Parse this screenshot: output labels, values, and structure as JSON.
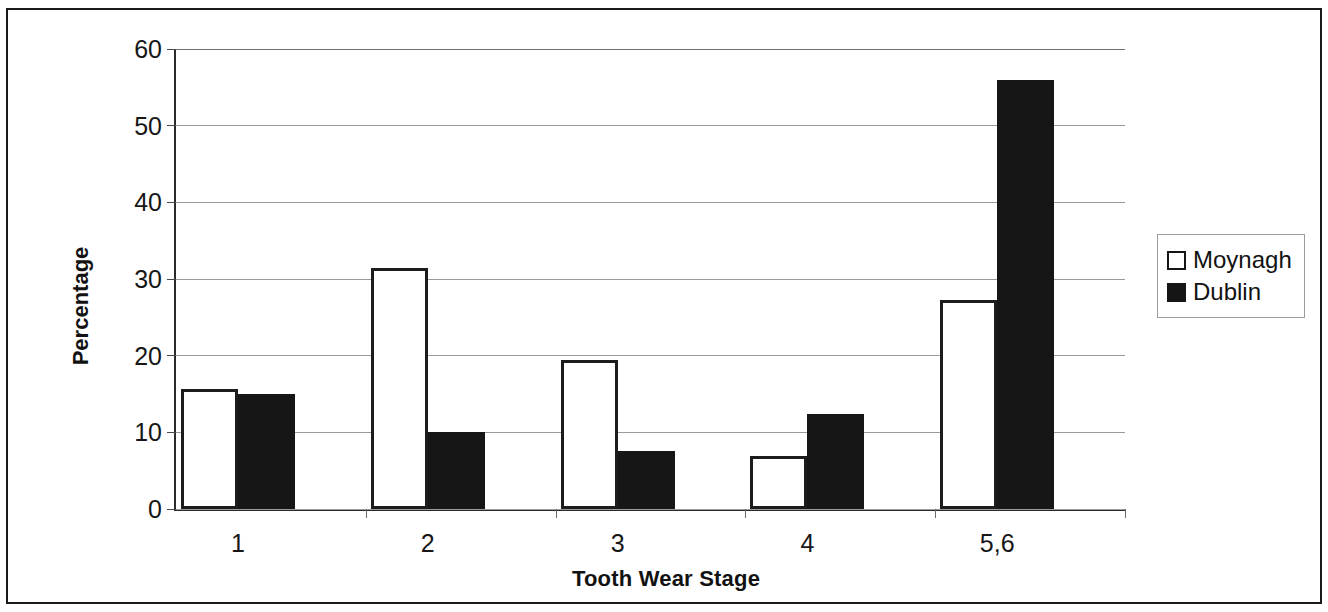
{
  "chart_data": {
    "type": "bar",
    "title": "",
    "subtitle": "",
    "xlabel": "Tooth Wear Stage",
    "ylabel": "Percentage",
    "categories": [
      "1",
      "2",
      "3",
      "4",
      "5,6"
    ],
    "series": [
      {
        "name": "Moynagh",
        "values": [
          15.6,
          31.4,
          19.5,
          6.9,
          27.2
        ],
        "color": "#ffffff",
        "edge_color": "#1c1c1c"
      },
      {
        "name": "Dublin",
        "values": [
          15.0,
          10.1,
          7.6,
          12.4,
          56.0
        ],
        "color": "#161616",
        "edge_color": "#161616"
      }
    ],
    "ylim": [
      0,
      60
    ],
    "yticks": [
      0,
      10,
      20,
      30,
      40,
      50,
      60
    ],
    "ytick_labels": [
      "0",
      "10",
      "20",
      "30",
      "40",
      "50",
      "60"
    ],
    "grid": "horizontal",
    "legend_position": "right",
    "legend_entries": [
      {
        "label": "Moynagh",
        "marker": "hollow-square"
      },
      {
        "label": "Dublin",
        "marker": "solid-square"
      }
    ]
  },
  "figure": {
    "border_color": "#1a1a1a",
    "background": "#ffffff"
  }
}
